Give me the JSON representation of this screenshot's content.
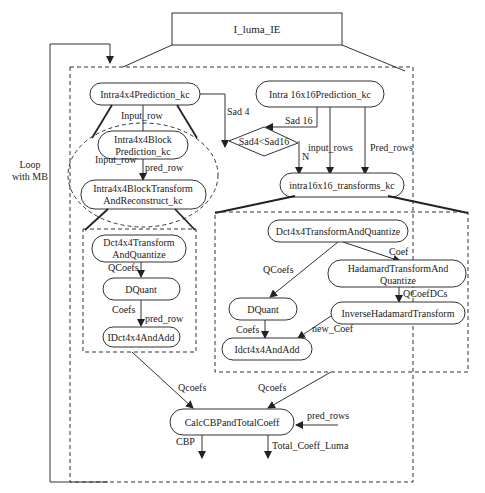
{
  "title": "I_luma_IE",
  "loop_label": [
    "Loop",
    "with MB"
  ],
  "nodes": {
    "intra4x4_pred": "Intra4x4Prediction_kc",
    "intra4x4_block_pred": [
      "Intra4x4Block",
      "Prediction_kc"
    ],
    "intra4x4_block_transform": [
      "Intra4x4BlockTransform",
      "AndReconstruct_kc"
    ],
    "intra16_pred": "Intra 16x16Prediction_kc",
    "decision": "Sad4<Sad16",
    "intra16_transforms": "intra16x16_transforms_kc",
    "left_dct": [
      "Dct4x4Transform",
      "AndQuantize"
    ],
    "left_dquant": "DQuant",
    "left_idct": "IDct4x4AndAdd",
    "right_dct": "Dct4x4TransformAndQuantize",
    "hadamard": [
      "HadamardTransformAnd",
      "Quantize"
    ],
    "right_dquant": "DQuant",
    "inverse_hadamard": "InverseHadamardTransform",
    "right_idct": "Idct4x4AndAdd",
    "calc_cbp": "CalcCBPandTotalCoeff"
  },
  "edges": {
    "input_row_1": "Input_row",
    "input_row_2": "Input_row",
    "pred_row_1": "pred_row",
    "sad4": "Sad 4",
    "sad16": "Sad 16",
    "n": "N",
    "input_rows": "input_rows",
    "pred_rows": "Pred_rows",
    "qcoefs_left": "QCoefs",
    "coefs_left": "Coefs",
    "pred_row_2": "pred_row",
    "coef": "Coef",
    "qcoefs_right": "QCoefs",
    "qcoefdcs": "QCoefDCs",
    "coefs_right": "Coefs",
    "new_coef": "new_Coef",
    "qcoefs_out_left": "Qcoefs",
    "qcoefs_out_right": "Qcoefs",
    "pred_rows_in": "pred_rows",
    "cbp": "CBP",
    "total_coeff": "Total_Coeff_Luma"
  }
}
